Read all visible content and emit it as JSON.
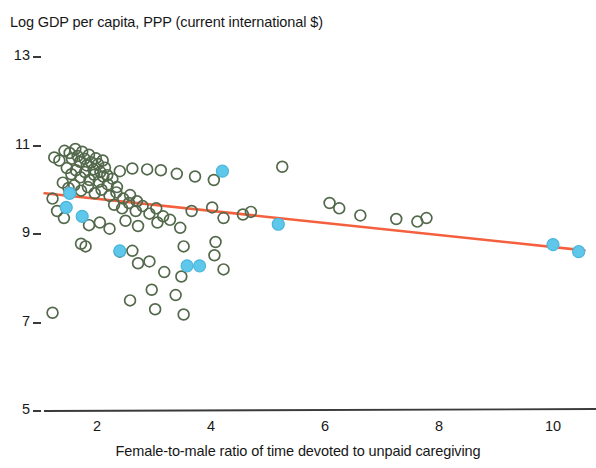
{
  "chart_data": {
    "type": "scatter",
    "title": "Log GDP per capita, PPP (current international $)",
    "xlabel": "Female-to-male ratio of time devoted to unpaid caregiving",
    "ylabel": "Log GDP per capita, PPP (current international $)",
    "xlim": [
      1.0,
      10.7
    ],
    "ylim": [
      5,
      13
    ],
    "grid": false,
    "legend": "none",
    "xticks": [
      "2",
      "4",
      "6",
      "8",
      "10"
    ],
    "xtick_values": [
      2,
      4,
      6,
      8,
      10
    ],
    "yticks": [
      "13",
      "11",
      "9",
      "7",
      "5"
    ],
    "ytick_values": [
      13,
      11,
      9,
      7,
      5
    ],
    "colors": {
      "series_green": "#53694b",
      "series_blue": "#5ec7ea",
      "trendline": "#f4603e",
      "axis": "#3a3a3a",
      "text": "#171717"
    },
    "series": [
      {
        "name": "other-countries",
        "marker": "open-circle",
        "color": "#53694b",
        "points": [
          [
            1.25,
            10.73
          ],
          [
            1.34,
            10.66
          ],
          [
            1.43,
            10.88
          ],
          [
            1.52,
            10.83
          ],
          [
            1.56,
            10.7
          ],
          [
            1.62,
            10.92
          ],
          [
            1.66,
            10.76
          ],
          [
            1.7,
            10.63
          ],
          [
            1.74,
            10.86
          ],
          [
            1.78,
            10.7
          ],
          [
            1.82,
            10.55
          ],
          [
            1.86,
            10.79
          ],
          [
            1.9,
            10.62
          ],
          [
            1.94,
            10.46
          ],
          [
            1.98,
            10.71
          ],
          [
            2.02,
            10.58
          ],
          [
            2.06,
            10.4
          ],
          [
            2.1,
            10.66
          ],
          [
            2.14,
            10.5
          ],
          [
            2.18,
            10.33
          ],
          [
            1.47,
            10.49
          ],
          [
            1.55,
            10.35
          ],
          [
            1.63,
            10.44
          ],
          [
            1.71,
            10.28
          ],
          [
            1.79,
            10.4
          ],
          [
            1.87,
            10.22
          ],
          [
            1.95,
            10.34
          ],
          [
            2.03,
            10.18
          ],
          [
            2.11,
            10.3
          ],
          [
            2.19,
            10.12
          ],
          [
            2.27,
            10.25
          ],
          [
            2.35,
            10.06
          ],
          [
            1.4,
            10.16
          ],
          [
            1.5,
            10.04
          ],
          [
            1.6,
            10.1
          ],
          [
            1.72,
            9.98
          ],
          [
            1.84,
            10.06
          ],
          [
            1.96,
            9.92
          ],
          [
            2.08,
            10.0
          ],
          [
            2.22,
            9.86
          ],
          [
            2.34,
            9.94
          ],
          [
            2.46,
            9.8
          ],
          [
            2.58,
            9.88
          ],
          [
            2.7,
            9.74
          ],
          [
            2.3,
            9.66
          ],
          [
            2.44,
            9.58
          ],
          [
            2.56,
            9.7
          ],
          [
            2.68,
            9.52
          ],
          [
            2.8,
            9.63
          ],
          [
            2.92,
            9.46
          ],
          [
            3.04,
            9.58
          ],
          [
            3.16,
            9.4
          ],
          [
            2.4,
            10.42
          ],
          [
            2.62,
            10.48
          ],
          [
            2.88,
            10.46
          ],
          [
            3.12,
            10.44
          ],
          [
            3.4,
            10.36
          ],
          [
            3.72,
            10.3
          ],
          [
            4.05,
            10.22
          ],
          [
            5.25,
            10.52
          ],
          [
            1.22,
            9.8
          ],
          [
            1.3,
            9.52
          ],
          [
            1.42,
            9.36
          ],
          [
            1.86,
            9.2
          ],
          [
            2.05,
            9.26
          ],
          [
            2.22,
            9.12
          ],
          [
            2.5,
            9.3
          ],
          [
            2.72,
            9.18
          ],
          [
            3.06,
            9.26
          ],
          [
            3.28,
            9.32
          ],
          [
            3.46,
            9.14
          ],
          [
            3.66,
            9.52
          ],
          [
            4.02,
            9.6
          ],
          [
            4.22,
            9.36
          ],
          [
            4.56,
            9.44
          ],
          [
            4.7,
            9.5
          ],
          [
            6.08,
            9.7
          ],
          [
            6.25,
            9.58
          ],
          [
            6.62,
            9.42
          ],
          [
            7.25,
            9.34
          ],
          [
            7.62,
            9.28
          ],
          [
            7.78,
            9.36
          ],
          [
            1.72,
            8.78
          ],
          [
            1.8,
            8.72
          ],
          [
            2.4,
            8.6
          ],
          [
            2.62,
            8.62
          ],
          [
            2.72,
            8.34
          ],
          [
            2.92,
            8.38
          ],
          [
            3.18,
            8.14
          ],
          [
            3.48,
            8.04
          ],
          [
            4.06,
            8.52
          ],
          [
            4.22,
            8.2
          ],
          [
            4.08,
            8.82
          ],
          [
            3.52,
            8.72
          ],
          [
            1.22,
            7.22
          ],
          [
            2.58,
            7.5
          ],
          [
            3.02,
            7.3
          ],
          [
            3.52,
            7.18
          ],
          [
            2.96,
            7.74
          ],
          [
            3.38,
            7.62
          ]
        ]
      },
      {
        "name": "highlighted-countries",
        "marker": "filled-circle",
        "color": "#5ec7ea",
        "points": [
          [
            1.52,
            9.92
          ],
          [
            1.46,
            9.6
          ],
          [
            1.74,
            9.4
          ],
          [
            2.4,
            8.62
          ],
          [
            3.58,
            8.28
          ],
          [
            3.8,
            8.28
          ],
          [
            4.2,
            10.42
          ],
          [
            5.18,
            9.22
          ],
          [
            10.0,
            8.76
          ],
          [
            10.45,
            8.6
          ]
        ]
      }
    ],
    "trendline": {
      "x_start": 1.08,
      "y_start": 9.92,
      "x_end": 10.55,
      "y_end": 8.63,
      "color": "#f4603e"
    }
  }
}
